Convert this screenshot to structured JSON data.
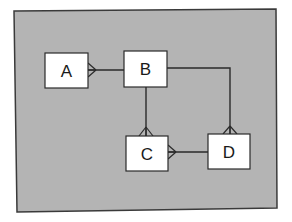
{
  "diagram": {
    "type": "entity-relationship",
    "notation": "crow's foot",
    "colors": {
      "panel_fill": "#b4b4b4",
      "panel_border": "#3a3a3a",
      "entity_fill": "#ffffff",
      "entity_border": "#2a2a2a",
      "line": "#2a2a2a"
    },
    "entities": [
      {
        "id": "A",
        "label": "A",
        "x": 45,
        "y": 53,
        "w": 43,
        "h": 35
      },
      {
        "id": "B",
        "label": "B",
        "x": 124,
        "y": 51,
        "w": 43,
        "h": 36
      },
      {
        "id": "C",
        "label": "C",
        "x": 126,
        "y": 136,
        "w": 42,
        "h": 35
      },
      {
        "id": "D",
        "label": "D",
        "x": 208,
        "y": 134,
        "w": 42,
        "h": 35
      }
    ],
    "relationships": [
      {
        "from": "B",
        "to": "A",
        "many_end": "A",
        "side": "right-of-A"
      },
      {
        "from": "B",
        "to": "C",
        "many_end": "C",
        "side": "top-of-C"
      },
      {
        "from": "B",
        "to": "D",
        "many_end": "D",
        "side": "top-of-D"
      },
      {
        "from": "D",
        "to": "C",
        "many_end": "C",
        "side": "right-of-C"
      }
    ]
  }
}
